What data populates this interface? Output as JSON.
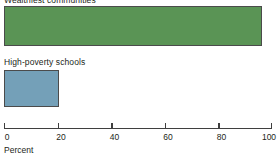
{
  "chart_data": {
    "type": "bar",
    "orientation": "horizontal",
    "title": "",
    "xlabel": "Percent",
    "ylabel": "",
    "xlim": [
      0,
      100
    ],
    "xticks": [
      0,
      20,
      40,
      60,
      80,
      100
    ],
    "xtick_labels": [
      "0",
      "20",
      "40",
      "60",
      "80",
      "100"
    ],
    "grid": false,
    "legend": false,
    "categories": [
      "Wealthiest communities",
      "High-poverty schools"
    ],
    "values": [
      96,
      20
    ],
    "bars": [
      {
        "label": "Wealthiest communities",
        "value": 96,
        "color": "#5a9455",
        "edge_color": "#4b4b4b"
      },
      {
        "label": "High-poverty schools",
        "value": 20,
        "color": "#74a0b8",
        "edge_color": "#4b4b4b"
      }
    ],
    "axis_color": "#3f3f3f",
    "text_color": "#231f20",
    "background": "#ffffff"
  }
}
